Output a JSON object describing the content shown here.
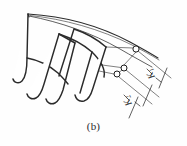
{
  "figure": {
    "caption": "(b)",
    "line_color": "#2b2b2b",
    "fill_color": "#ffffff",
    "background": "#ffffff"
  },
  "dimensions": [
    {
      "id": "k1",
      "symbol": "K",
      "subscript": "1",
      "label": "K1",
      "position": "upper-right",
      "rotation_deg": -118
    },
    {
      "id": "k2",
      "symbol": "K",
      "subscript": "2",
      "label": "K2",
      "position": "lower-right",
      "rotation_deg": -118
    }
  ],
  "nodes": [
    {
      "id": "node-top",
      "cx": 136,
      "cy": 49,
      "r": 3.1
    },
    {
      "id": "node-mid",
      "cx": 124,
      "cy": 68,
      "r": 3.0
    },
    {
      "id": "node-bottom",
      "cx": 117,
      "cy": 74,
      "r": 3.0
    }
  ],
  "blades": [
    {
      "id": "blade-1"
    },
    {
      "id": "blade-2"
    },
    {
      "id": "blade-3"
    },
    {
      "id": "blade-4"
    }
  ]
}
